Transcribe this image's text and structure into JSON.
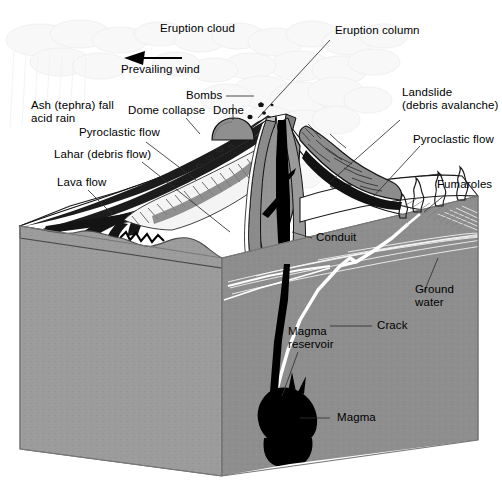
{
  "figure": {
    "kind": "labelled geological block diagram",
    "palette": {
      "background": "#ffffff",
      "rock_front_face": "#9b9b9b",
      "rock_side_face": "#8e8e8e",
      "rock_top_face": "#a8a8a8",
      "magma_black": "#000000",
      "snow_white": "#ffffff",
      "ash_cloud_gray": "#e8e8e8",
      "flank_gray": "#8f8f8f",
      "label_text": "#000000",
      "leader_line": "#3a3a3a",
      "crack_white": "#ffffff"
    }
  },
  "labels": {
    "eruption_cloud": "Eruption cloud",
    "eruption_column": "Eruption column",
    "prevailing_wind": "Prevailing wind",
    "bombs": "Bombs",
    "dome_collapse": "Dome collapse",
    "dome": "Dome",
    "ash_fall_line1": "Ash (tephra) fall",
    "ash_fall_line2": "acid rain",
    "pyroclastic_flow_left": "Pyroclastic flow",
    "lahar": "Lahar (debris flow)",
    "lava_flow": "Lava flow",
    "landslide_line1": "Landslide",
    "landslide_line2": "(debris avalanche)",
    "pyroclastic_flow_right": "Pyroclastic flow",
    "fumaroles": "Fumaroles",
    "conduit": "Conduit",
    "ground_water_line1": "Ground",
    "ground_water_line2": "water",
    "crack": "Crack",
    "magma_reservoir_line1": "Magma",
    "magma_reservoir_line2": "reservoir",
    "magma": "Magma"
  },
  "annotations": {
    "wind_arrow_direction": "left",
    "leader_count": 14
  }
}
